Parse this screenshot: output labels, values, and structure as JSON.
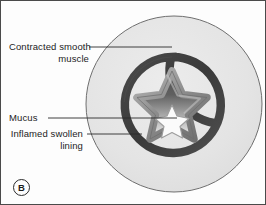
{
  "figure": {
    "panel_letter": "B",
    "background_color": "#fdfdfd",
    "border_color": "#4a4a4a"
  },
  "labels": {
    "contracted_muscle": "Contracted smooth\nmuscle",
    "mucus": "Mucus",
    "inflamed_lining": "Inflamed swollen\nlining"
  },
  "anatomy": {
    "outer_tissue": {
      "name": "surrounding-tissue",
      "fill": "#e3e3e3",
      "stroke": "#6b6b6b",
      "center_x": 173,
      "center_y": 103,
      "radius": 88
    },
    "smooth_muscle_band": {
      "name": "contracted-smooth-muscle-spiral",
      "color": "#3d3d3d",
      "stroke_width": 8,
      "center_x": 171,
      "center_y": 104,
      "radius": 48
    },
    "inflamed_lining": {
      "name": "inflamed-swollen-lining",
      "color": "#8a8a8a",
      "highlight": "#b9b9b9",
      "stroke_width": 7
    },
    "lumen": {
      "name": "narrowed-lumen",
      "gradient_top": "#555555",
      "gradient_bottom": "#f2f2f2"
    },
    "mucus_plug": {
      "name": "mucus-plug",
      "fill": "#fafafa",
      "stroke": "#9a9a9a"
    }
  },
  "leader_lines": {
    "contracted_muscle": {
      "x1": 88,
      "y1": 46,
      "x2": 171,
      "y2": 46
    },
    "mucus": {
      "x1": 47,
      "y1": 117,
      "x2": 176,
      "y2": 117
    },
    "inflamed_lining": {
      "x1": 86,
      "y1": 133,
      "x2": 141,
      "y2": 133
    },
    "color": "#2b2b2b",
    "width": 0.8
  }
}
